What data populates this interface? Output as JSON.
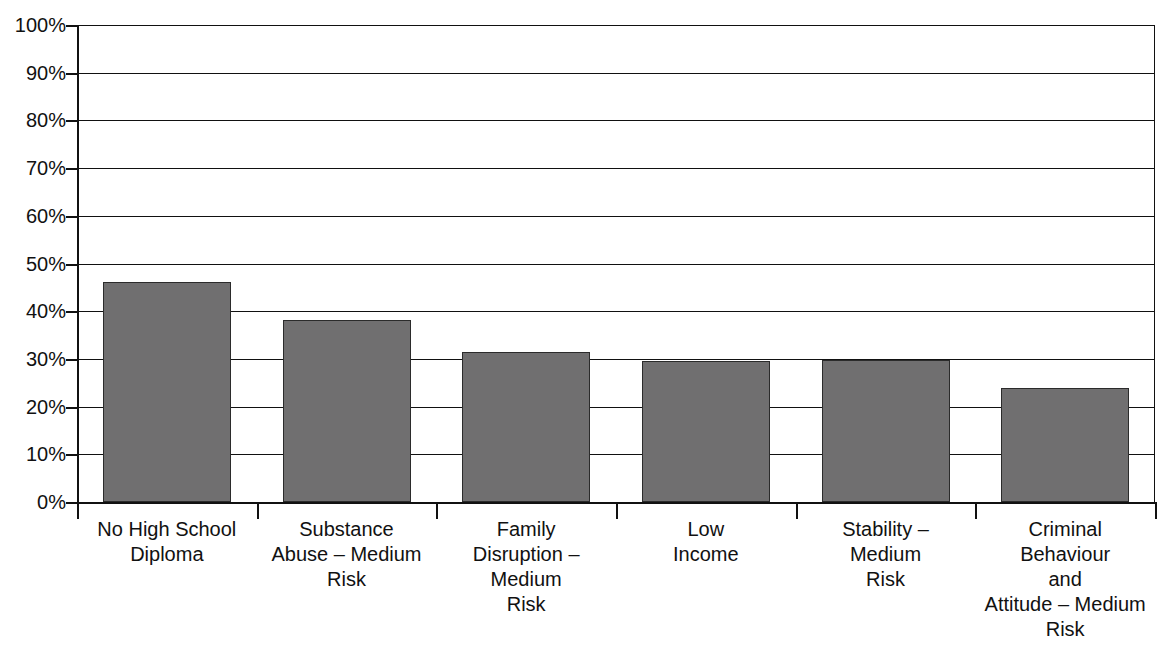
{
  "chart_data": {
    "type": "bar",
    "title": "",
    "subtitle": "",
    "xlabel": "",
    "ylabel": "",
    "ylim": [
      0,
      100
    ],
    "y_unit": "%",
    "grid": true,
    "legend": "none",
    "orientation": "vertical",
    "bar_color": "#706f70",
    "bar_border_color": "#2b2b2b",
    "background_color": "#ffffff",
    "axis_color": "#111111",
    "categories": [
      "No High School Diploma",
      "Substance Abuse – Medium Risk",
      "Family Disruption – Medium Risk",
      "Low Income",
      "Stability – Medium Risk",
      "Criminal Behaviour and Attitude – Medium Risk"
    ],
    "category_lines": [
      [
        "No High School",
        "Diploma"
      ],
      [
        "Substance",
        "Abuse – Medium",
        "Risk"
      ],
      [
        "Family",
        "Disruption – Medium",
        "Risk"
      ],
      [
        "Low",
        "Income"
      ],
      [
        "Stability –",
        "Medium",
        "Risk"
      ],
      [
        "Criminal",
        "Behaviour",
        "and",
        "Attitude – Medium",
        "Risk"
      ]
    ],
    "values": [
      46.2,
      38.2,
      31.5,
      29.5,
      29.8,
      23.8
    ],
    "value_labels": [
      "46%",
      "38%",
      "32%",
      "30%",
      "30%",
      "24%"
    ],
    "yticks": [
      0,
      10,
      20,
      30,
      40,
      50,
      60,
      70,
      80,
      90,
      100
    ],
    "ytick_labels": [
      "0%",
      "10%",
      "20%",
      "30%",
      "40%",
      "50%",
      "60%",
      "70%",
      "80%",
      "90%",
      "100%"
    ]
  }
}
